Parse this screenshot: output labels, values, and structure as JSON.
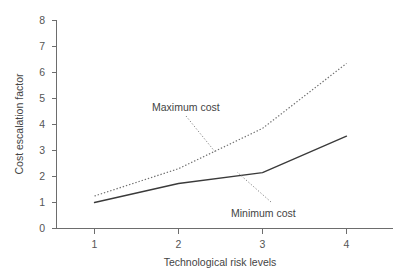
{
  "chart_data": {
    "type": "line",
    "title": "",
    "subtitle": "",
    "xlabel": "Technological risk levels",
    "ylabel": "Cost escalation factor",
    "x": [
      1,
      2,
      3,
      4
    ],
    "categories": [
      "1",
      "2",
      "3",
      "4"
    ],
    "xtick_labels": [
      "1",
      "2",
      "3",
      "4"
    ],
    "ytick_labels": [
      "0",
      "1",
      "2",
      "3",
      "4",
      "5",
      "6",
      "7",
      "8"
    ],
    "yticks": [
      0,
      1,
      2,
      3,
      4,
      5,
      6,
      7,
      8
    ],
    "xlim": [
      0.6,
      4.55
    ],
    "ylim": [
      0,
      8
    ],
    "grid": false,
    "legend": "none",
    "series": [
      {
        "name": "Maximum cost",
        "style": "dotted",
        "color": "#707070",
        "values": [
          1.25,
          2.3,
          3.85,
          6.35
        ]
      },
      {
        "name": "Minimum cost",
        "style": "solid",
        "color": "#3a3a3a",
        "values": [
          1.0,
          1.73,
          2.15,
          3.55
        ]
      }
    ],
    "annotations": [
      {
        "text": "Maximum cost",
        "attached_series": "Maximum cost",
        "label_x": 152,
        "label_y": 111,
        "leader_from_x": 186,
        "leader_from_y": 116,
        "leader_to_x": 216,
        "leader_to_y": 153
      },
      {
        "text": "Minimum cost",
        "attached_series": "Minimum cost",
        "label_x": 231,
        "label_y": 213,
        "leader_from_x": 271,
        "leader_from_y": 202,
        "leader_to_x": 237,
        "leader_to_y": 172
      }
    ]
  },
  "axis": {
    "y_title": "Cost escalation factor",
    "x_title": "Technological risk levels",
    "y_ticks": [
      "8",
      "7",
      "6",
      "5",
      "4",
      "3",
      "2",
      "1",
      "0"
    ],
    "x_ticks": [
      "1",
      "2",
      "3",
      "4"
    ]
  }
}
